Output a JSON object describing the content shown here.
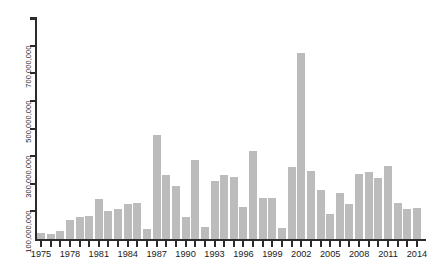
{
  "chart_data": {
    "type": "bar",
    "title": "",
    "subtitle": "",
    "xlabel": "",
    "ylabel": "",
    "grid": false,
    "legend": null,
    "bar_color": "#bcbcbc",
    "axis_color": "#2b2b2b",
    "xlim": [
      1974.5,
      2014.5
    ],
    "ylim": [
      0,
      800000000
    ],
    "y_tick_interval": 100000000,
    "y_tick_values": [
      100000000,
      200000000,
      300000000,
      400000000,
      500000000,
      600000000,
      700000000,
      800000000
    ],
    "y_tick_labels": [
      "100,000,000",
      "",
      "300,000,000",
      "",
      "500,000,000",
      "",
      "700,000,000",
      ""
    ],
    "x_tick_labels": [
      "1975",
      "1978",
      "1981",
      "1984",
      "1987",
      "1990",
      "1993",
      "1996",
      "1999",
      "2002",
      "2005",
      "2008",
      "2011",
      "2014"
    ],
    "x_label_interval": 3,
    "categories": [
      1975,
      1976,
      1977,
      1978,
      1979,
      1980,
      1981,
      1982,
      1983,
      1984,
      1985,
      1986,
      1987,
      1988,
      1989,
      1990,
      1991,
      1992,
      1993,
      1994,
      1995,
      1996,
      1997,
      1998,
      1999,
      2000,
      2001,
      2002,
      2003,
      2004,
      2005,
      2006,
      2007,
      2008,
      2009,
      2010,
      2011,
      2012,
      2013,
      2014
    ],
    "values": [
      22000000,
      18000000,
      30000000,
      70000000,
      78000000,
      85000000,
      145000000,
      100000000,
      107000000,
      126000000,
      130000000,
      36000000,
      378000000,
      232000000,
      193000000,
      78000000,
      285000000,
      44000000,
      210000000,
      230000000,
      225000000,
      117000000,
      320000000,
      147000000,
      148000000,
      40000000,
      260000000,
      674000000,
      245000000,
      178000000,
      90000000,
      165000000,
      125000000,
      235000000,
      243000000,
      222000000,
      266000000,
      130000000,
      107000000,
      112000000
    ]
  }
}
